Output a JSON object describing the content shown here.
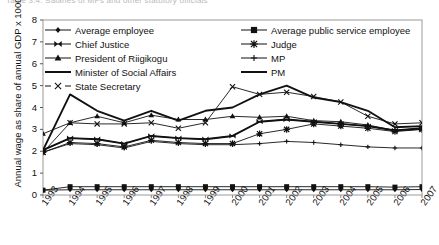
{
  "figure": {
    "caption": "Table 3.4.  Salaries of MPs and other statutory officials"
  },
  "axes": {
    "ylabel": "Annual wage as share of annual GDP x 1000,000",
    "yticks": [
      "0",
      "1",
      "2",
      "3",
      "4",
      "5",
      "6",
      "7",
      "8"
    ],
    "ylim": [
      0,
      8
    ],
    "xticks": [
      "1993",
      "1994",
      "1995",
      "1996",
      "1997",
      "1998",
      "1999",
      "2000",
      "2001",
      "2002",
      "2003",
      "2004",
      "2005",
      "2006",
      "2007"
    ]
  },
  "legend": {
    "entries": [
      {
        "label": "Average employee",
        "marker": "diamond",
        "key": "avg-employee"
      },
      {
        "label": "Average public service employee",
        "marker": "square",
        "key": "avg-public-service-employee"
      },
      {
        "label": "Chief Justice",
        "marker": "bowtie",
        "key": "chief-justice"
      },
      {
        "label": "Judge",
        "marker": "star",
        "key": "judge"
      },
      {
        "label": "President of Riigikogu",
        "marker": "triangle",
        "key": "president-of-riigikogu"
      },
      {
        "label": "MP",
        "marker": "plus",
        "key": "mp"
      },
      {
        "label": "Minister of Social Affairs",
        "marker": "none",
        "key": "minister-of-social-affairs"
      },
      {
        "label": "PM",
        "marker": "none",
        "key": "pm"
      },
      {
        "label": "State Secretary",
        "marker": "cross",
        "key": "state-secretary"
      }
    ]
  },
  "chart_data": {
    "type": "line",
    "title": "Table 3.4.  Salaries of MPs and other statutory officials",
    "xlabel": "",
    "ylabel": "Annual wage as share of annual GDP x 1000,000",
    "ylim": [
      0,
      8
    ],
    "grid": false,
    "legend_position": "top-inside",
    "categories": [
      "1993",
      "1994",
      "1995",
      "1996",
      "1997",
      "1998",
      "1999",
      "2000",
      "2001",
      "2002",
      "2003",
      "2004",
      "2005",
      "2006",
      "2007"
    ],
    "series": [
      {
        "name": "Average employee",
        "marker": "diamond",
        "values": [
          0.22,
          0.24,
          0.24,
          0.24,
          0.24,
          0.24,
          0.24,
          0.24,
          0.24,
          0.24,
          0.24,
          0.24,
          0.24,
          0.24,
          0.25
        ]
      },
      {
        "name": "Average public service employee",
        "marker": "square",
        "values": [
          0.22,
          0.38,
          0.38,
          0.38,
          0.38,
          0.38,
          0.38,
          0.38,
          0.38,
          0.38,
          0.38,
          0.38,
          0.38,
          0.36,
          0.38
        ]
      },
      {
        "name": "Chief Justice",
        "marker": "bowtie",
        "values": [
          2.05,
          2.6,
          2.55,
          2.35,
          2.7,
          2.6,
          2.55,
          2.7,
          3.35,
          3.45,
          3.35,
          3.25,
          3.15,
          2.95,
          3.0
        ]
      },
      {
        "name": "Judge",
        "marker": "star",
        "values": [
          1.95,
          2.4,
          2.35,
          2.2,
          2.5,
          2.4,
          2.35,
          2.35,
          2.8,
          3.0,
          3.25,
          3.15,
          3.05,
          2.9,
          3.0
        ]
      },
      {
        "name": "President of Riigikogu",
        "marker": "triangle",
        "values": [
          2.8,
          3.3,
          3.6,
          3.3,
          3.65,
          3.45,
          3.45,
          3.6,
          3.55,
          3.6,
          3.4,
          3.35,
          3.2,
          2.95,
          3.05
        ]
      },
      {
        "name": "MP",
        "marker": "plus",
        "values": [
          1.95,
          2.35,
          2.3,
          2.15,
          2.45,
          2.35,
          2.3,
          2.3,
          2.35,
          2.45,
          2.4,
          2.3,
          2.2,
          2.15,
          2.15
        ]
      },
      {
        "name": "Minister of Social Affairs",
        "marker": "none",
        "values": [
          2.05,
          4.6,
          3.85,
          3.4,
          3.85,
          3.4,
          3.85,
          4.0,
          4.6,
          5.0,
          4.45,
          4.25,
          3.85,
          3.1,
          3.15
        ]
      },
      {
        "name": "PM",
        "marker": "none",
        "values": [
          2.05,
          2.6,
          2.55,
          2.35,
          2.7,
          2.6,
          2.55,
          2.7,
          3.35,
          3.45,
          3.35,
          3.25,
          3.15,
          2.95,
          3.05
        ]
      },
      {
        "name": "State Secretary",
        "marker": "cross",
        "values": [
          1.95,
          3.3,
          3.25,
          3.25,
          3.3,
          3.05,
          3.3,
          4.95,
          4.6,
          4.7,
          4.5,
          4.25,
          3.6,
          3.25,
          3.3
        ]
      }
    ]
  }
}
